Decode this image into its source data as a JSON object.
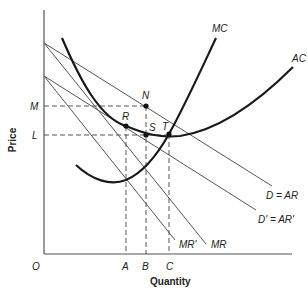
{
  "diagram": {
    "type": "monopoly cost and revenue diagram",
    "axes": {
      "y_label": "Price",
      "x_label": "Quantity",
      "origin_label": "O"
    },
    "price_levels": [
      {
        "label": "M",
        "y": 106
      },
      {
        "label": "L",
        "y": 135
      }
    ],
    "quantity_levels": [
      {
        "label": "A",
        "x": 126
      },
      {
        "label": "B",
        "x": 146
      },
      {
        "label": "C",
        "x": 169
      }
    ],
    "points": [
      {
        "label": "N",
        "x": 146,
        "y": 106
      },
      {
        "label": "R",
        "x": 126,
        "y": 126
      },
      {
        "label": "S",
        "x": 146,
        "y": 135
      },
      {
        "label": "T",
        "x": 169,
        "y": 134
      }
    ],
    "curves": {
      "mc": "MC",
      "ac": "AC",
      "d_ar": "D = AR",
      "d_ar_prime": "D' = AR'",
      "mr": "MR",
      "mr_prime": "MR'"
    },
    "colors": {
      "line": "#444444",
      "thick_curve": "#1a1a1a",
      "text": "#222222",
      "background": "#ffffff"
    }
  }
}
